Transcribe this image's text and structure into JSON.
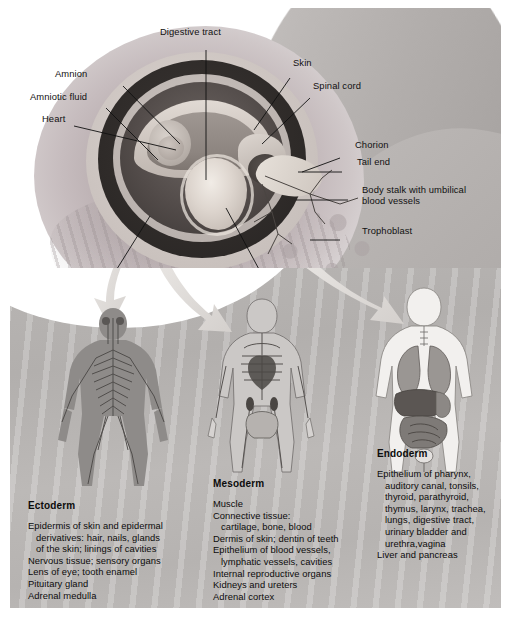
{
  "figure": {
    "background_color": "#b6b3b1",
    "scene_top_background": "#ffffff"
  },
  "embryo_labels": [
    {
      "name": "digestive-tract",
      "text": "Digestive tract"
    },
    {
      "name": "skin",
      "text": "Skin"
    },
    {
      "name": "spinal-cord",
      "text": "Spinal cord"
    },
    {
      "name": "amnion",
      "text": "Amnion"
    },
    {
      "name": "amniotic-fluid",
      "text": "Amniotic fluid"
    },
    {
      "name": "heart",
      "text": "Heart"
    },
    {
      "name": "chorion",
      "text": "Chorion"
    },
    {
      "name": "tail-end",
      "text": "Tail end"
    },
    {
      "name": "body-stalk-line1",
      "text": "Body stalk with umbilical"
    },
    {
      "name": "body-stalk-line2",
      "text": "blood vessels"
    },
    {
      "name": "trophoblast",
      "text": "Trophoblast"
    },
    {
      "name": "brain",
      "text": "Brain"
    },
    {
      "name": "yolk-sac",
      "text": "Yolk sac"
    }
  ],
  "germ_layers": [
    {
      "id": "ectoderm",
      "heading": "Ectoderm",
      "figure_depicts": "nervous-system-figure",
      "derivatives": [
        "Epidermis of skin and epidermal",
        "   derivatives: hair, nails, glands",
        "   of the skin; linings of cavities",
        "Nervous tissue; sensory organs",
        "Lens of eye; tooth enamel",
        "Pituitary gland",
        "Adrenal medulla"
      ]
    },
    {
      "id": "mesoderm",
      "heading": "Mesoderm",
      "figure_depicts": "skeleton-muscle-figure",
      "derivatives": [
        "Muscle",
        "Connective tissue:",
        "   cartilage, bone, blood",
        "Dermis of skin; dentin of teeth",
        "Epithelium of blood vessels,",
        "   lymphatic vessels, cavities",
        "Internal reproductive organs",
        "Kidneys and ureters",
        "Adrenal cortex"
      ]
    },
    {
      "id": "endoderm",
      "heading": "Endoderm",
      "figure_depicts": "internal-organs-figure",
      "derivatives": [
        "Epithelium of pharynx,",
        "   auditory canal, tonsils,",
        "   thyroid, parathyroid,",
        "   thymus, larynx, trachea,",
        "   lungs, digestive tract,",
        "   urinary bladder and",
        "   urethra,vagina",
        "Liver and pancreas"
      ]
    }
  ]
}
